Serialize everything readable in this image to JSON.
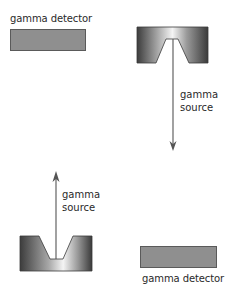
{
  "diagram": {
    "top_left": {
      "detector_label": "gamma detector"
    },
    "top_right": {
      "source_label_line1": "gamma",
      "source_label_line2": "source",
      "arrow_direction": "down"
    },
    "bottom_left": {
      "source_label_line1": "gamma",
      "source_label_line2": "source",
      "arrow_direction": "up"
    },
    "bottom_right": {
      "detector_label": "gamma detector"
    },
    "colors": {
      "detector_fill": "#8f8f8f",
      "detector_border": "#5a5a5a",
      "source_dark": "#3a3a3a",
      "source_light": "#f2f2f2",
      "arrow": "#555555",
      "text": "#2a2a2a"
    }
  }
}
